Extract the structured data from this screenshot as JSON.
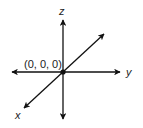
{
  "diagram": {
    "type": "3d-coordinate-axes",
    "origin_label": "(0, 0, 0)",
    "axes": {
      "z": {
        "label": "z"
      },
      "y": {
        "label": "y"
      },
      "x": {
        "label": "x"
      }
    },
    "colors": {
      "line": "#111111",
      "text": "#222222",
      "background": "#ffffff"
    }
  }
}
